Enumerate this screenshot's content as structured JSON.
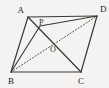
{
  "figure": {
    "type": "geometry-diagram",
    "background_color": "#f4f3f1",
    "stroke_color": "#3a3836",
    "dotted_color": "#56524f",
    "label_color": "#23211f",
    "canvas": {
      "width": 109,
      "height": 88
    },
    "points": [
      {
        "id": "A",
        "label": "A",
        "x": 28,
        "y": 17,
        "label_x": 24,
        "label_y": 13,
        "anchor": "end"
      },
      {
        "id": "D",
        "label": "D",
        "x": 97,
        "y": 16,
        "label_x": 100,
        "label_y": 12,
        "anchor": "start"
      },
      {
        "id": "B",
        "label": "B",
        "x": 11,
        "y": 72,
        "label_x": 9,
        "label_y": 83,
        "anchor": "start"
      },
      {
        "id": "C",
        "label": "C",
        "x": 81,
        "y": 72,
        "label_x": 79,
        "label_y": 83,
        "anchor": "start"
      },
      {
        "id": "P",
        "label": "P",
        "x": 40,
        "y": 26,
        "label_x": 39,
        "label_y": 24,
        "anchor": "start"
      },
      {
        "id": "O",
        "label": "O",
        "x": 54,
        "y": 44,
        "label_x": 51,
        "label_y": 51,
        "anchor": "start"
      }
    ],
    "segments": [
      {
        "name": "side-AD",
        "from": "A",
        "to": "D",
        "style": "solid"
      },
      {
        "name": "side-AB",
        "from": "A",
        "to": "B",
        "style": "solid"
      },
      {
        "name": "side-BC",
        "from": "B",
        "to": "C",
        "style": "solid"
      },
      {
        "name": "side-DC",
        "from": "D",
        "to": "C",
        "style": "solid"
      },
      {
        "name": "diagonal-AC",
        "from": "A",
        "to": "C",
        "style": "solid"
      },
      {
        "name": "diagonal-BD",
        "from": "B",
        "to": "D",
        "style": "dotted"
      },
      {
        "name": "segment-BP",
        "from": "B",
        "to": "P",
        "style": "solid"
      },
      {
        "name": "segment-PD",
        "from": "P",
        "to": "D",
        "style": "solid"
      }
    ]
  }
}
